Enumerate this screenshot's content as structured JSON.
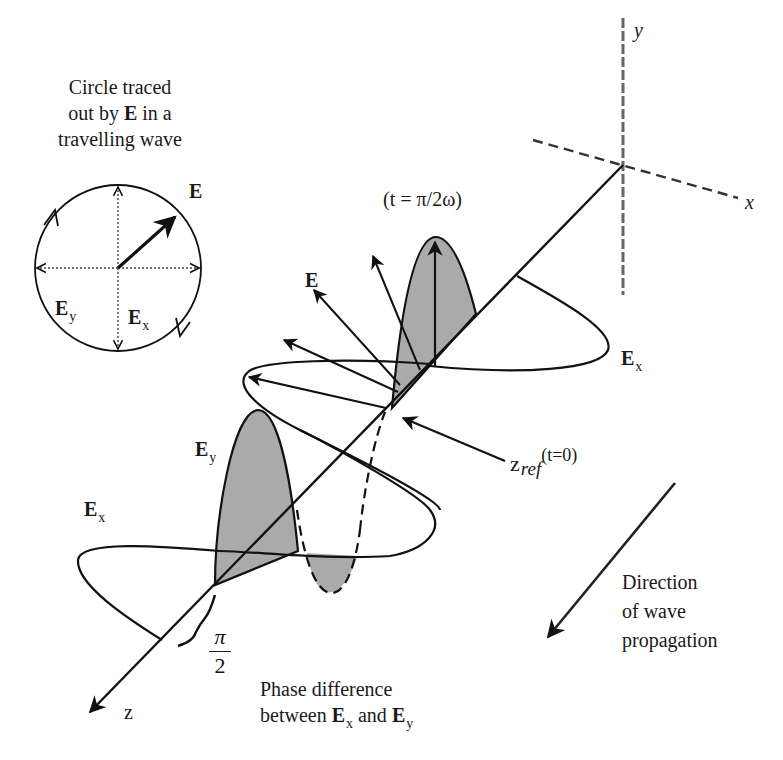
{
  "circle_panel": {
    "caption_lines": [
      "Circle traced",
      "out by",
      "E",
      "in a",
      "travelling wave"
    ],
    "caption_line1": "Circle traced",
    "caption_line2_pre": "out by ",
    "caption_line2_bold": "E",
    "caption_line2_post": " in a",
    "caption_line3": "travelling wave",
    "vector_label": "E",
    "ey_label": "E",
    "ey_sub": "y",
    "ex_label": "E",
    "ex_sub": "x"
  },
  "axes": {
    "y_label": "y",
    "x_label": "x",
    "z_label": "z"
  },
  "wave": {
    "time_label": "(t = π/2ω)",
    "e_vector_label": "E",
    "ex_right_label": "E",
    "ex_right_sub": "x",
    "ey_label": "E",
    "ey_sub": "y",
    "ex_left_label": "E",
    "ex_left_sub": "x",
    "zref_label": "z",
    "zref_sub": "ref",
    "zref_sup": "(t=0)"
  },
  "phase": {
    "numerator": "π",
    "denominator": "2",
    "caption_line1": "Phase difference",
    "caption_line2_pre": "between ",
    "ex_label": "E",
    "ex_sub": "x",
    "and": " and ",
    "ey_label": "E",
    "ey_sub": "y"
  },
  "propagation": {
    "caption_lines": [
      "Direction",
      "of wave",
      "propagation"
    ],
    "line1": "Direction",
    "line2": "of wave",
    "line3": "propagation"
  },
  "colors": {
    "stroke": "#111111",
    "shade": "#a9a9a9",
    "axis_dash": "#555555",
    "background": "#ffffff"
  }
}
